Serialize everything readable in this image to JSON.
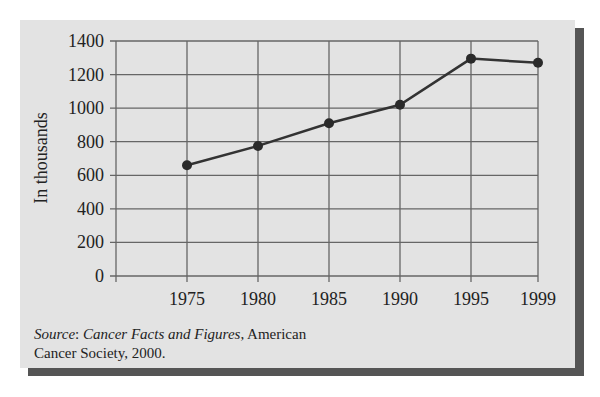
{
  "chart_data": {
    "type": "line",
    "title": "",
    "xlabel": "",
    "ylabel": "In thousands",
    "categories": [
      "1975",
      "1980",
      "1985",
      "1990",
      "1995",
      "1999"
    ],
    "x": [
      1975,
      1980,
      1985,
      1990,
      1995,
      1999
    ],
    "series": [
      {
        "name": "New cancer cases",
        "values": [
          660,
          775,
          910,
          1020,
          1295,
          1270
        ]
      }
    ],
    "yticks": [
      0,
      200,
      400,
      600,
      800,
      1000,
      1200,
      1400
    ],
    "xticks": [
      "1975",
      "1980",
      "1985",
      "1990",
      "1995",
      "1999"
    ],
    "ylim": [
      0,
      1400
    ],
    "grid": true,
    "legend": "none"
  },
  "source": {
    "label": "Source",
    "colon": ": ",
    "title": "Cancer Facts and Figures",
    "rest_line1": ", American",
    "line2": "Cancer Society, 2000."
  },
  "colors": {
    "panel": "#e3e3e3",
    "shadow": "#555555",
    "grid": "#666666",
    "line": "#333333",
    "marker": "#2a2a2a"
  }
}
